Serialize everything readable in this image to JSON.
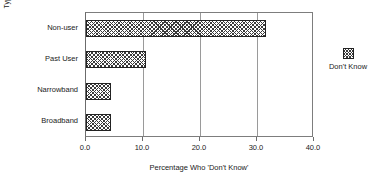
{
  "chart_data": {
    "type": "bar",
    "orientation": "horizontal",
    "title": "",
    "xlabel": "Percentage Who 'Don't Know'",
    "ylabel": "Type of user/non-user",
    "categories": [
      "Non-user",
      "Past User",
      "Narrowband",
      "Broadband"
    ],
    "series": [
      {
        "name": "Don't Know",
        "values": [
          31.6,
          10.5,
          4.4,
          4.4
        ]
      }
    ],
    "xlim": [
      0.0,
      40.0
    ],
    "xticks": [
      0.0,
      10.0,
      20.0,
      30.0,
      40.0
    ],
    "xtick_labels": [
      "0.0",
      "10.0",
      "20.0",
      "30.0",
      "40.0"
    ],
    "grid": "vertical",
    "legend": {
      "position": "right",
      "entries": [
        "Don't Know"
      ]
    },
    "colors": {
      "bar_edge": "#222222",
      "bar_hatch": "#3a3a3a",
      "bar_fill": "#ffffff",
      "frame": "#7d7d7d",
      "gridline": "#9a9a9a",
      "text": "#1a1a1a",
      "background": "#ffffff"
    }
  }
}
